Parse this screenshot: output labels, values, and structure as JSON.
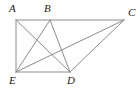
{
  "figure": {
    "background_color": "#ffffff",
    "stroke_color": "#8c8c8c",
    "label_color": "#1b1b1b",
    "width": 140,
    "height": 94,
    "points": {
      "A": {
        "label": "A",
        "x": 16,
        "y": 20,
        "label_x": 9,
        "label_y": 3
      },
      "B": {
        "label": "B",
        "x": 50,
        "y": 20,
        "label_x": 44,
        "label_y": 3
      },
      "C": {
        "label": "C",
        "x": 124,
        "y": 20,
        "label_x": 128,
        "label_y": 7
      },
      "D": {
        "label": "D",
        "x": 70,
        "y": 72,
        "label_x": 67,
        "label_y": 75
      },
      "E": {
        "label": "E",
        "x": 16,
        "y": 72,
        "label_x": 9,
        "label_y": 75
      }
    },
    "segments": [
      {
        "name": "segment-A-C",
        "from": "A",
        "to": "C",
        "x1": 16,
        "y1": 20,
        "x2": 124,
        "y2": 20
      },
      {
        "name": "segment-A-E",
        "from": "A",
        "to": "E",
        "x1": 16,
        "y1": 20,
        "x2": 16,
        "y2": 72
      },
      {
        "name": "segment-E-D",
        "from": "E",
        "to": "D",
        "x1": 16,
        "y1": 72,
        "x2": 70,
        "y2": 72
      },
      {
        "name": "segment-A-D",
        "from": "A",
        "to": "D",
        "x1": 16,
        "y1": 20,
        "x2": 70,
        "y2": 72
      },
      {
        "name": "segment-B-E",
        "from": "B",
        "to": "E",
        "x1": 50,
        "y1": 20,
        "x2": 16,
        "y2": 72
      },
      {
        "name": "segment-B-D",
        "from": "B",
        "to": "D",
        "x1": 50,
        "y1": 20,
        "x2": 70,
        "y2": 72
      },
      {
        "name": "segment-E-C",
        "from": "E",
        "to": "C",
        "x1": 16,
        "y1": 72,
        "x2": 124,
        "y2": 20
      },
      {
        "name": "segment-D-C",
        "from": "D",
        "to": "C",
        "x1": 70,
        "y1": 72,
        "x2": 124,
        "y2": 20
      }
    ]
  }
}
